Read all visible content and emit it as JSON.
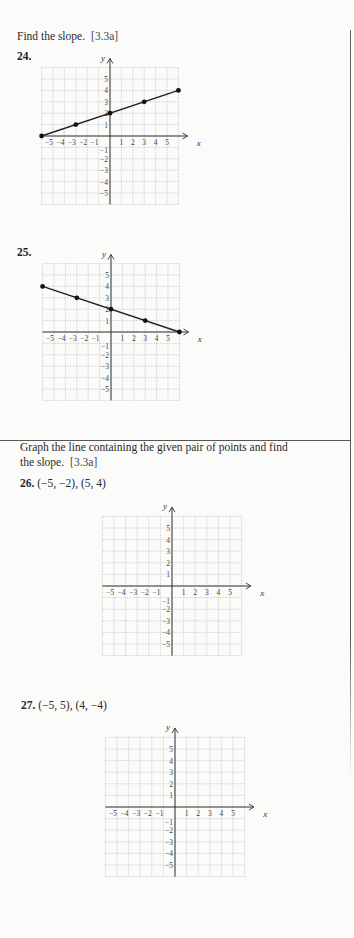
{
  "section1": {
    "instruction": "Find the slope.",
    "ref": "[3.3a]"
  },
  "section2": {
    "instruction_line1": "Graph the line containing the given pair of points and find",
    "instruction_line2": "the slope.",
    "ref": "[3.3a]"
  },
  "exercises": [
    {
      "number": "24.",
      "points_text": ""
    },
    {
      "number": "25.",
      "points_text": ""
    },
    {
      "number": "26.",
      "points_text": "(−5, −2), (5, 4)"
    },
    {
      "number": "27.",
      "points_text": "(−5, 5), (4, −4)"
    }
  ],
  "axis": {
    "x_label": "x",
    "y_label": "y",
    "x_ticks": [
      "−5",
      "−4",
      "−3",
      "−2",
      "−1",
      "1",
      "2",
      "3",
      "4",
      "5"
    ],
    "y_ticks_pos": [
      "1",
      "2",
      "3",
      "4",
      "5"
    ],
    "y_ticks_neg": [
      "−1",
      "−2",
      "−3",
      "−4",
      "−5"
    ]
  },
  "chart_data": [
    {
      "type": "line",
      "title": "24.",
      "xlabel": "x",
      "ylabel": "y",
      "xlim": [
        -6,
        6
      ],
      "ylim": [
        -6,
        6
      ],
      "grid": true,
      "points": [
        [
          -6,
          0
        ],
        [
          -3,
          1
        ],
        [
          0,
          2
        ],
        [
          3,
          3
        ],
        [
          6,
          4
        ]
      ]
    },
    {
      "type": "line",
      "title": "25.",
      "xlabel": "x",
      "ylabel": "y",
      "xlim": [
        -6,
        6
      ],
      "ylim": [
        -6,
        6
      ],
      "grid": true,
      "points": [
        [
          -6,
          4
        ],
        [
          -3,
          3
        ],
        [
          0,
          2
        ],
        [
          3,
          1
        ],
        [
          6,
          0
        ]
      ]
    },
    {
      "type": "line",
      "title": "26. (−5, −2), (5, 4)",
      "xlabel": "x",
      "ylabel": "y",
      "xlim": [
        -6,
        6
      ],
      "ylim": [
        -6,
        6
      ],
      "grid": true,
      "points": []
    },
    {
      "type": "line",
      "title": "27. (−5, 5), (4, −4)",
      "xlabel": "x",
      "ylabel": "y",
      "xlim": [
        -6,
        6
      ],
      "ylim": [
        -6,
        6
      ],
      "grid": true,
      "points": []
    }
  ]
}
